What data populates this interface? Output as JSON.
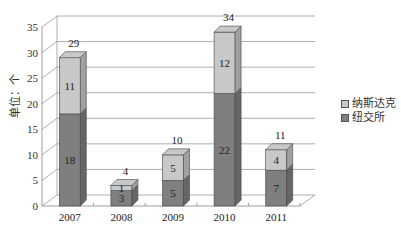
{
  "chart_data": {
    "type": "bar",
    "stacked": true,
    "style": "3d-column",
    "title": "",
    "xlabel": "",
    "ylabel": "单位：个",
    "ylim": [
      0,
      35
    ],
    "yticks": [
      0,
      5,
      10,
      15,
      20,
      25,
      30,
      35
    ],
    "grid": true,
    "legend_position": "right",
    "categories": [
      "2007",
      "2008",
      "2009",
      "2010",
      "2011"
    ],
    "series": [
      {
        "name": "纽交所",
        "color": "#7f7f7f",
        "values": [
          18,
          3,
          5,
          22,
          7
        ]
      },
      {
        "name": "纳斯达克",
        "color": "#c8c8c8",
        "values": [
          11,
          1,
          5,
          12,
          4
        ]
      }
    ],
    "totals": [
      29,
      4,
      10,
      34,
      11
    ]
  },
  "legend": {
    "items": [
      {
        "label": "纳斯达克",
        "color": "#c8c8c8"
      },
      {
        "label": "纽交所",
        "color": "#7f7f7f"
      }
    ]
  },
  "axis": {
    "ylabel": "单位：个"
  }
}
